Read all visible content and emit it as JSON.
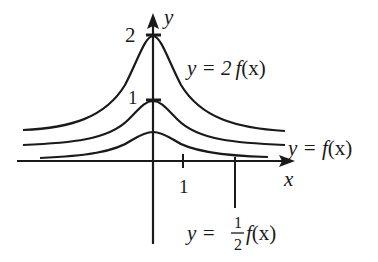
{
  "diagram": {
    "axes": {
      "x_label": "x",
      "y_label": "y",
      "x_tick_label": "1"
    },
    "peak_labels": {
      "upper": "2",
      "middle": "1"
    },
    "curves": [
      {
        "id": "double",
        "label_prefix": "y = 2",
        "label_fn": "f",
        "label_arg": "(x)",
        "peak_value": 2
      },
      {
        "id": "original",
        "label_prefix": "y = ",
        "label_fn": "f",
        "label_arg": "(x)",
        "peak_value": 1
      },
      {
        "id": "half",
        "label_prefix": "y = ",
        "label_frac_num": "1",
        "label_frac_den": "2",
        "label_fn": "f",
        "label_arg": "(x)",
        "peak_value": 0.5
      }
    ],
    "colors": {
      "stroke": "#1a1a1a",
      "background": "#ffffff"
    }
  }
}
